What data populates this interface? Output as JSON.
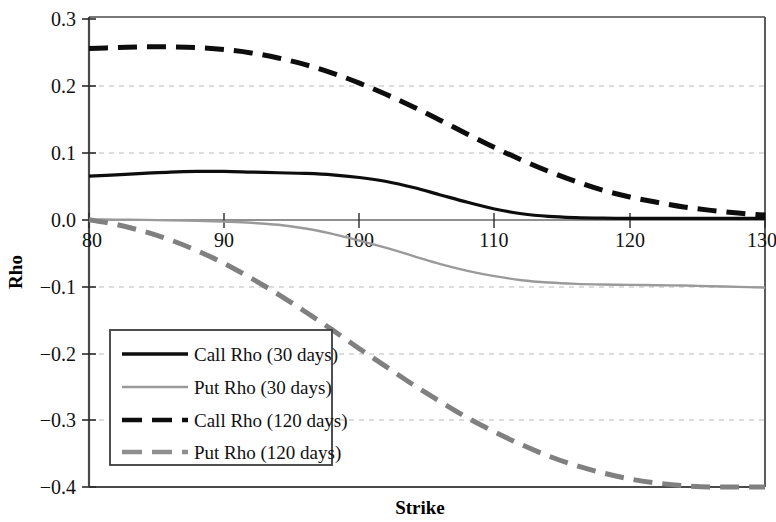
{
  "chart_data": {
    "type": "line",
    "title": "",
    "xlabel": "Strike",
    "ylabel": "Rho",
    "xlim": [
      80,
      130
    ],
    "ylim": [
      -0.4,
      0.3
    ],
    "xticks": [
      80,
      90,
      100,
      110,
      120,
      130
    ],
    "yticks": [
      0.3,
      0.2,
      0.1,
      0.0,
      -0.1,
      -0.2,
      -0.3,
      -0.4
    ],
    "xtick_labels": [
      "80",
      "90",
      "100",
      "110",
      "120",
      "130"
    ],
    "ytick_labels": [
      "0.3",
      "0.2",
      "0.1",
      "0.0",
      "−0.1",
      "−0.2",
      "−0.3",
      "−0.4"
    ],
    "grid": true,
    "grid_axis": "y",
    "grid_style": "dashed",
    "legend_position": "lower-left-inside",
    "x": [
      80,
      82,
      84,
      86,
      88,
      90,
      92,
      94,
      96,
      98,
      100,
      102,
      104,
      106,
      108,
      110,
      112,
      114,
      116,
      118,
      120,
      122,
      124,
      126,
      128,
      130
    ],
    "series": [
      {
        "name": "Call Rho (30 days)",
        "color": "#0d0d0d",
        "style": "solid",
        "width": 3.2,
        "values": [
          0.063,
          0.065,
          0.067,
          0.069,
          0.07,
          0.07,
          0.069,
          0.068,
          0.067,
          0.065,
          0.061,
          0.055,
          0.046,
          0.035,
          0.024,
          0.014,
          0.007,
          0.003,
          0.0012,
          0.0004,
          0.0001,
          0.0,
          0.0,
          0.0,
          0.0,
          0.0
        ]
      },
      {
        "name": "Put Rho (30 days)",
        "color": "#9a9a9a",
        "style": "solid",
        "width": 2.4,
        "values": [
          -0.0015,
          -0.0018,
          -0.0022,
          -0.0028,
          -0.0036,
          -0.0048,
          -0.0065,
          -0.0095,
          -0.015,
          -0.023,
          -0.033,
          -0.044,
          -0.056,
          -0.068,
          -0.078,
          -0.086,
          -0.092,
          -0.0955,
          -0.0975,
          -0.0985,
          -0.099,
          -0.0995,
          -0.1,
          -0.101,
          -0.102,
          -0.103
        ]
      },
      {
        "name": "Call Rho (120 days)",
        "color": "#0d0d0d",
        "style": "dashed",
        "width": 5.0,
        "values": [
          0.253,
          0.2545,
          0.2555,
          0.2555,
          0.2545,
          0.2515,
          0.2465,
          0.239,
          0.229,
          0.2165,
          0.2015,
          0.1845,
          0.166,
          0.146,
          0.1255,
          0.1055,
          0.087,
          0.07,
          0.055,
          0.042,
          0.032,
          0.024,
          0.017,
          0.012,
          0.008,
          0.005
        ]
      },
      {
        "name": "Put Rho (120 days)",
        "color": "#808080",
        "style": "dashed",
        "width": 5.0,
        "values": [
          -0.002,
          -0.009,
          -0.019,
          -0.032,
          -0.048,
          -0.067,
          -0.089,
          -0.113,
          -0.139,
          -0.166,
          -0.194,
          -0.221,
          -0.248,
          -0.273,
          -0.297,
          -0.318,
          -0.337,
          -0.354,
          -0.368,
          -0.379,
          -0.388,
          -0.394,
          -0.398,
          -0.4,
          -0.401,
          -0.401
        ]
      }
    ]
  },
  "axes": {
    "y_title": "Rho",
    "x_title": "Strike"
  },
  "legend": {
    "entries": [
      {
        "label": "Call Rho (30 days)"
      },
      {
        "label": "Put Rho (30 days)"
      },
      {
        "label": "Call Rho (120 days)"
      },
      {
        "label": "Put Rho (120 days)"
      }
    ]
  }
}
